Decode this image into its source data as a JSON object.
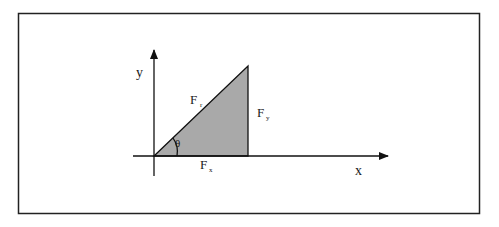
{
  "diagram": {
    "labels": {
      "y_axis": "y",
      "x_axis": "x",
      "resultant": "F",
      "resultant_sub": "r",
      "fy": "F",
      "fy_sub": "y",
      "fx": "F",
      "fx_sub": "x",
      "angle": "θ"
    },
    "colors": {
      "fill": "#a9a9a9",
      "stroke": "#111111",
      "frame": "#222222"
    }
  }
}
